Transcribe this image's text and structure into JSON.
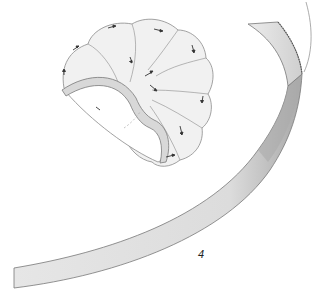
{
  "figure": {
    "label": "4",
    "colors": {
      "background": "#ffffff",
      "band_fill": "#e2e2e2",
      "band_shadow": "#b9b9b9",
      "outline": "#7a7a7a",
      "shell_fill": "#f1f1f1",
      "rim_fill": "#d8d8d8",
      "arrow": "#333333"
    }
  }
}
